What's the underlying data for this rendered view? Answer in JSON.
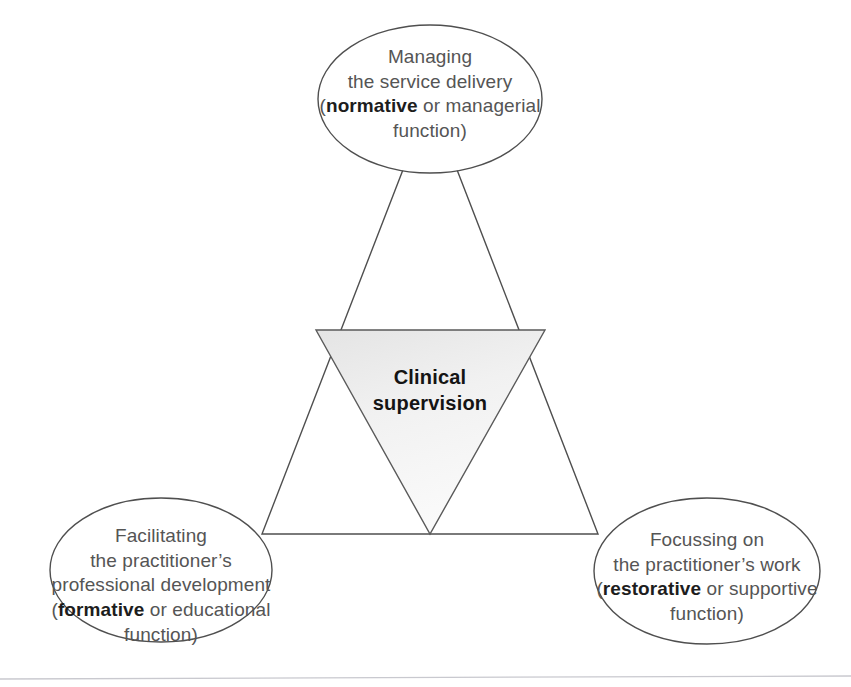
{
  "figure": {
    "type": "diagram",
    "subtype": "venn-triangle-model",
    "background_color": "#ffffff",
    "stroke_color": "#4a4a4a",
    "text_color": "#555555",
    "emphasis_color": "#1d1d1d",
    "inner_triangle_fill": "#f0f0f0"
  },
  "center": {
    "name": "clinical-supervision",
    "lines": [
      "Clinical",
      "supervision"
    ],
    "bold": true
  },
  "nodes": [
    {
      "id": "managing",
      "position": "top",
      "lines": [
        {
          "text": "Managing",
          "bold": false
        },
        {
          "text": "the service delivery",
          "bold": false
        },
        {
          "pre": "(",
          "bold_word": "normative",
          "post": " or managerial"
        },
        {
          "text": "function)",
          "bold": false
        }
      ],
      "keyword": "normative"
    },
    {
      "id": "facilitating",
      "position": "bottom-left",
      "lines": [
        {
          "text": "Facilitating",
          "bold": false
        },
        {
          "text": "the practitioner’s",
          "bold": false
        },
        {
          "text": "professional development",
          "bold": false
        },
        {
          "pre": "(",
          "bold_word": "formative",
          "post": " or educational"
        },
        {
          "text": "function)",
          "bold": false
        }
      ],
      "keyword": "formative"
    },
    {
      "id": "focussing",
      "position": "bottom-right",
      "lines": [
        {
          "text": "Focussing on",
          "bold": false
        },
        {
          "text": "the practitioner’s work",
          "bold": false
        },
        {
          "pre": "(",
          "bold_word": "restorative",
          "post": " or supportive"
        },
        {
          "text": "function)",
          "bold": false
        }
      ],
      "keyword": "restorative"
    }
  ],
  "footer_rule": {
    "name": "page-rule",
    "visible": true
  }
}
